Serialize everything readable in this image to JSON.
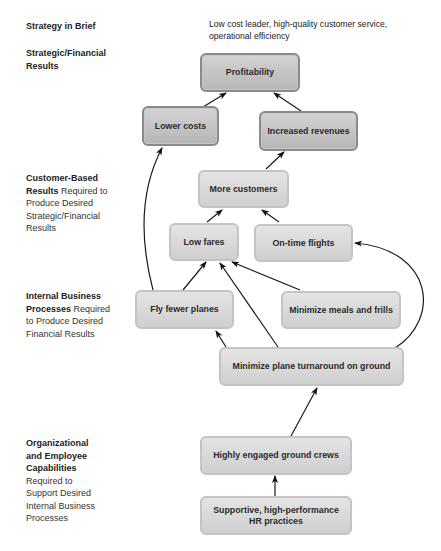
{
  "diagram": {
    "strategy_in_brief": {
      "label": "Strategy in Brief",
      "text": "Low cost leader, high-quality customer service, operational efficiency"
    },
    "perspectives": [
      {
        "bold": "Strategic/Financial Results",
        "rest": ""
      },
      {
        "bold": "Customer-Based Results",
        "rest": "Required to Produce Desired Strategic/Financial Results"
      },
      {
        "bold": "Internal Business Processes",
        "rest": "Required to Produce Desired Financial Results"
      },
      {
        "bold": "Organizational and Employee Capabilities",
        "rest": "Required to Support Desired Internal Business Processes"
      }
    ],
    "nodes": {
      "profitability": "Profitability",
      "lower_costs": "Lower costs",
      "increased_revenues": "Increased revenues",
      "more_customers": "More customers",
      "low_fares": "Low fares",
      "on_time_flights": "On-time flights",
      "fly_fewer_planes": "Fly fewer planes",
      "minimize_meals": "Minimize meals and frills",
      "minimize_turnaround": "Minimize plane turnaround on ground",
      "engaged_crews": "Highly engaged ground crews",
      "hr_practices_line1": "Supportive, high-performance",
      "hr_practices_line2": "HR practices"
    },
    "edges": [
      [
        "lower_costs",
        "profitability"
      ],
      [
        "increased_revenues",
        "profitability"
      ],
      [
        "more_customers",
        "increased_revenues"
      ],
      [
        "low_fares",
        "more_customers"
      ],
      [
        "on_time_flights",
        "more_customers"
      ],
      [
        "fly_fewer_planes",
        "low_fares"
      ],
      [
        "fly_fewer_planes",
        "lower_costs"
      ],
      [
        "minimize_meals",
        "low_fares"
      ],
      [
        "minimize_turnaround",
        "low_fares"
      ],
      [
        "minimize_turnaround",
        "fly_fewer_planes"
      ],
      [
        "minimize_turnaround",
        "on_time_flights"
      ],
      [
        "engaged_crews",
        "minimize_turnaround"
      ],
      [
        "hr_practices",
        "engaged_crews"
      ]
    ]
  }
}
